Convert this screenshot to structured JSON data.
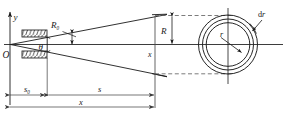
{
  "figure": {
    "type": "optics-ray-diagram",
    "stroke_color": "#1a1a1a",
    "dashed_color": "#5a5a5a",
    "dimension_color": "#3c3c3c",
    "background": "#ffffff"
  },
  "axes": {
    "origin_label": "O",
    "y_axis_label": "y",
    "x_axis_label": "x"
  },
  "labels": {
    "beam_waist_radius": "R",
    "beam_waist_radius_sub": "0",
    "half_angle": "θ",
    "screen_radius": "R",
    "ring_radius": "r",
    "ring_thickness_d": "d",
    "ring_thickness_r": "r"
  },
  "dimensions": [
    {
      "name": "s0",
      "label": "s",
      "sublabel": "0",
      "from_x": 10,
      "to_x": 47,
      "row": 1
    },
    {
      "name": "s",
      "label": "s",
      "sublabel": "",
      "from_x": 47,
      "to_x": 155,
      "row": 1
    },
    {
      "name": "x",
      "label": "x",
      "sublabel": "",
      "from_x": 10,
      "to_x": 155,
      "row": 2
    }
  ],
  "aperture": {
    "name": "slit-plates",
    "upper_plate": {
      "x": 22,
      "y": 30,
      "width": 25,
      "height": 7
    },
    "lower_plate": {
      "x": 22,
      "y": 51,
      "width": 25,
      "height": 7
    },
    "hatch_count": 7
  },
  "cross_section": {
    "center_x": 228,
    "center_y": 44,
    "radii": [
      39,
      34,
      29
    ],
    "inner_ring_radius": 22,
    "ring_label_r": "r",
    "ring_label_dr": "dr"
  }
}
